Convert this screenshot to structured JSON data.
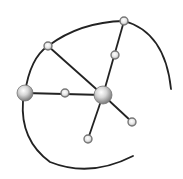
{
  "diagram": {
    "type": "network-graph-icon",
    "background": "#ffffff",
    "stroke_color": "#222222",
    "node_fill_light": "#f4f4f4",
    "node_fill_dark": "#8a8a8a",
    "node_stroke": "#777777",
    "nodes": [
      {
        "id": "hub-left",
        "x": 25,
        "y": 93,
        "r": 8,
        "kind": "large"
      },
      {
        "id": "hub-center",
        "x": 103,
        "y": 95,
        "r": 9,
        "kind": "large"
      },
      {
        "id": "node-top-left",
        "x": 48,
        "y": 46,
        "r": 4,
        "kind": "small"
      },
      {
        "id": "node-top-right",
        "x": 124,
        "y": 21,
        "r": 4,
        "kind": "small"
      },
      {
        "id": "node-upper-mid",
        "x": 115,
        "y": 55,
        "r": 4,
        "kind": "small"
      },
      {
        "id": "node-mid-left",
        "x": 65,
        "y": 93,
        "r": 4,
        "kind": "small"
      },
      {
        "id": "node-lower-right",
        "x": 132,
        "y": 122,
        "r": 4,
        "kind": "small"
      },
      {
        "id": "node-bottom",
        "x": 88,
        "y": 139,
        "r": 4,
        "kind": "small"
      }
    ],
    "edges": [
      {
        "from": "hub-left",
        "to": "hub-center"
      },
      {
        "from": "node-top-left",
        "to": "hub-center"
      },
      {
        "from": "node-top-right",
        "to": "hub-center"
      },
      {
        "from": "hub-center",
        "to": "node-lower-right"
      },
      {
        "from": "hub-center",
        "to": "node-bottom"
      }
    ],
    "arcs": [
      {
        "id": "outer-arc-top",
        "path": "M25,93 Q30,58 48,46 Q80,22 124,21 Q165,32 171,89"
      },
      {
        "id": "outer-arc-bottom",
        "path": "M23,101 Q20,140 50,162 Q90,178 133,156"
      }
    ]
  }
}
